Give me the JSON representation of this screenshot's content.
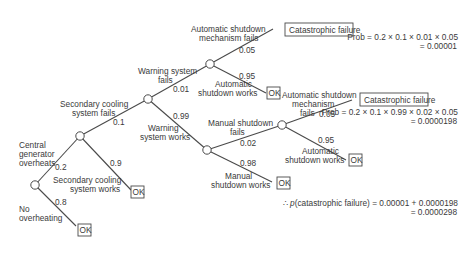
{
  "nodes": {
    "root": {
      "x": 35,
      "y": 185
    },
    "secondary_cooling": {
      "x": 80,
      "y": 136
    },
    "warning_system": {
      "x": 148,
      "y": 99
    },
    "automatic_shutdown_1": {
      "x": 210,
      "y": 64
    },
    "manual_shutdown": {
      "x": 207,
      "y": 150
    },
    "automatic_shutdown_2": {
      "x": 282,
      "y": 125
    }
  },
  "branches": {
    "overheats": {
      "label_lines": [
        "Central",
        "generator",
        "overheats"
      ],
      "prob": "0.2"
    },
    "no_overheating": {
      "label_lines": [
        "No",
        "overheating"
      ],
      "prob": "0.8"
    },
    "sec_fails": {
      "label_lines": [
        "Secondary cooling",
        "system fails"
      ],
      "prob": "0.1"
    },
    "sec_works": {
      "label_lines": [
        "Secondary cooling",
        "system works"
      ],
      "prob": "0.9"
    },
    "warn_fails": {
      "label_lines": [
        "Warning system",
        "fails"
      ],
      "prob": "0.01"
    },
    "warn_works": {
      "label_lines": [
        "Warning",
        "system works"
      ],
      "prob": "0.99"
    },
    "auto1_fails": {
      "label_lines": [
        "Automatic shutdown",
        "mechanism fails"
      ],
      "prob": "0.05"
    },
    "auto1_works": {
      "label_lines": [
        "Automatic",
        "shutdown works"
      ],
      "prob": "0.95"
    },
    "manual_fails": {
      "label_lines": [
        "Manual shutdown",
        "fails"
      ],
      "prob": "0.02"
    },
    "manual_works": {
      "label_lines": [
        "Manual",
        "shutdown works"
      ],
      "prob": "0.98"
    },
    "auto2_fails": {
      "label_lines": [
        "Automatic shutdown",
        "mechanism",
        "fails"
      ],
      "prob": "0.05"
    },
    "auto2_works": {
      "label_lines": [
        "Automatic",
        "shutdown works"
      ],
      "prob": "0.95"
    }
  },
  "outcomes": {
    "ok": "OK",
    "failure": "Catastrophic failure"
  },
  "calculations": {
    "path1": {
      "line1": "Prob = 0.2 × 0.1 × 0.01 × 0.05",
      "line2": "= 0.00001"
    },
    "path2": {
      "line1": "Prob = 0.2 × 0.1 × 0.99 × 0.02 × 0.05",
      "line2": "= 0.0000198"
    },
    "total": {
      "prefix": "∴ ",
      "p": "p",
      "line1": "(catastrophic failure) = 0.00001 + 0.0000198",
      "line2": "= 0.0000298"
    }
  }
}
